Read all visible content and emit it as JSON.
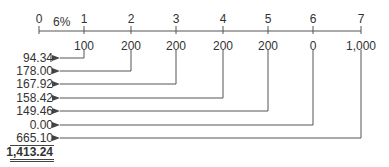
{
  "diagram": {
    "type": "cash-flow-timeline",
    "rate_label": "6%",
    "periods": [
      "0",
      "1",
      "2",
      "3",
      "4",
      "5",
      "6",
      "7"
    ],
    "cash_flows": [
      {
        "period": "1",
        "amount": "100",
        "present_value": "94.34"
      },
      {
        "period": "2",
        "amount": "200",
        "present_value": "178.00"
      },
      {
        "period": "3",
        "amount": "200",
        "present_value": "167.92"
      },
      {
        "period": "4",
        "amount": "200",
        "present_value": "158.42"
      },
      {
        "period": "5",
        "amount": "200",
        "present_value": "149.46"
      },
      {
        "period": "6",
        "amount": "0",
        "present_value": "0.00"
      },
      {
        "period": "7",
        "amount": "1,000",
        "present_value": "665.10"
      }
    ],
    "total_present_value": "1,413.24",
    "colors": {
      "line": "#555555",
      "text": "#333333",
      "background": "#ffffff"
    }
  }
}
